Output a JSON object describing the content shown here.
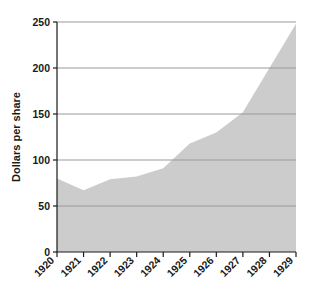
{
  "chart_data": {
    "type": "area",
    "title": "",
    "xlabel": "",
    "ylabel": "Dollars per share",
    "x": [
      1920,
      1921,
      1922,
      1923,
      1924,
      1925,
      1926,
      1927,
      1928,
      1929
    ],
    "categories": [
      "1920",
      "1921",
      "1922",
      "1923",
      "1924",
      "1925",
      "1926",
      "1927",
      "1928",
      "1929"
    ],
    "values": [
      80,
      67,
      79,
      82,
      91,
      118,
      130,
      152,
      200,
      248
    ],
    "series": [
      {
        "name": "Dollars per share",
        "values": [
          80,
          67,
          79,
          82,
          91,
          118,
          130,
          152,
          200,
          248
        ]
      }
    ],
    "xlim": [
      1920,
      1929
    ],
    "ylim": [
      0,
      250
    ],
    "ytick_labels": [
      "0",
      "50",
      "100",
      "150",
      "200",
      "250"
    ],
    "ytick_values": [
      0,
      50,
      100,
      150,
      200,
      250
    ],
    "xtick_labels": [
      "1920",
      "1921",
      "1922",
      "1923",
      "1924",
      "1925",
      "1926",
      "1927",
      "1928",
      "1929"
    ],
    "grid": true,
    "grid_axis": "y",
    "legend": "none",
    "xtick_label_rotation": 45,
    "area_fill_color": "#cccccc",
    "gridline_color": "#9a9a9a",
    "axis_color": "#1a1a1a",
    "background_color": "#ffffff"
  },
  "axis": {
    "y_title": "Dollars per share"
  },
  "yticks": [
    {
      "label": "250",
      "value": 250
    },
    {
      "label": "200",
      "value": 200
    },
    {
      "label": "150",
      "value": 150
    },
    {
      "label": "100",
      "value": 100
    },
    {
      "label": "50",
      "value": 50
    },
    {
      "label": "0",
      "value": 0
    }
  ],
  "xticks": [
    {
      "label": "1920",
      "value": 1920
    },
    {
      "label": "1921",
      "value": 1921
    },
    {
      "label": "1922",
      "value": 1922
    },
    {
      "label": "1923",
      "value": 1923
    },
    {
      "label": "1924",
      "value": 1924
    },
    {
      "label": "1925",
      "value": 1925
    },
    {
      "label": "1926",
      "value": 1926
    },
    {
      "label": "1927",
      "value": 1927
    },
    {
      "label": "1928",
      "value": 1928
    },
    {
      "label": "1929",
      "value": 1929
    }
  ]
}
